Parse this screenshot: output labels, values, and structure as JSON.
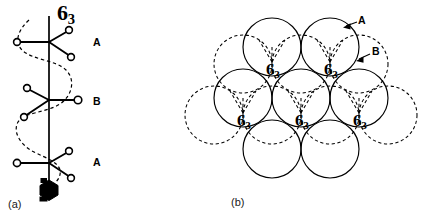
{
  "figure": {
    "panels": [
      {
        "id": "a",
        "caption": "(a)",
        "description": "6_3 screw axis with stacked A B A layers",
        "screw_axis": {
          "symbol_main": "6",
          "symbol_sub": "3",
          "label_x": 57,
          "label_y": 4,
          "font_size": 22
        },
        "layer_labels": [
          {
            "text": "A",
            "x": 93,
            "y": 36
          },
          {
            "text": "B",
            "x": 93,
            "y": 95
          },
          {
            "text": "A",
            "x": 93,
            "y": 156
          }
        ],
        "nodes": [
          {
            "layer": "A",
            "hub": {
              "x": 49,
              "y": 42
            },
            "arms": [
              {
                "x": 17,
                "y": 42
              },
              {
                "x": 69,
                "y": 30
              },
              {
                "x": 71,
                "y": 57
              }
            ]
          },
          {
            "layer": "B",
            "hub": {
              "x": 49,
              "y": 100
            },
            "arms": [
              {
                "x": 27,
                "y": 88
              },
              {
                "x": 24,
                "y": 117
              },
              {
                "x": 78,
                "y": 100
              }
            ]
          },
          {
            "layer": "A",
            "hub": {
              "x": 49,
              "y": 163
            },
            "arms": [
              {
                "x": 17,
                "y": 163
              },
              {
                "x": 69,
                "y": 151
              },
              {
                "x": 71,
                "y": 178
              }
            ]
          }
        ],
        "axis": {
          "x": 49,
          "y_top": 16,
          "y_bottom": 186
        },
        "screw_symbol_marker": {
          "x": 49,
          "y": 189,
          "radius": 9
        }
      },
      {
        "id": "b",
        "caption": "(b)",
        "description": "Hexagonal close packed layers A (solid) and B (dashed) with 6_3 screw axis positions",
        "pointer_labels": [
          {
            "text": "A",
            "label_x": 158,
            "label_y": 16,
            "tip_x": 144,
            "tip_y": 27,
            "tail_x": 157,
            "tail_y": 22
          },
          {
            "text": "B",
            "label_x": 172,
            "label_y": 47,
            "tip_x": 156,
            "tip_y": 61,
            "tail_x": 170,
            "tail_y": 54
          }
        ],
        "circle_radius": 29,
        "layer_a_circles": [
          {
            "cx": 72,
            "cy": 47
          },
          {
            "cx": 130,
            "cy": 47
          },
          {
            "cx": 43,
            "cy": 98
          },
          {
            "cx": 101,
            "cy": 98
          },
          {
            "cx": 159,
            "cy": 98
          },
          {
            "cx": 72,
            "cy": 149
          },
          {
            "cx": 130,
            "cy": 149
          }
        ],
        "layer_b_circles": [
          {
            "cx": 43,
            "cy": 64
          },
          {
            "cx": 101,
            "cy": 64
          },
          {
            "cx": 159,
            "cy": 64
          },
          {
            "cx": 14,
            "cy": 115
          },
          {
            "cx": 72,
            "cy": 115
          },
          {
            "cx": 130,
            "cy": 115
          },
          {
            "cx": 188,
            "cy": 115
          }
        ],
        "screw_axis_labels": [
          {
            "symbol_main": "6",
            "symbol_sub": "3",
            "x": 66,
            "y": 70,
            "font_size": 17
          },
          {
            "symbol_main": "6",
            "symbol_sub": "3",
            "x": 124,
            "y": 70,
            "font_size": 17
          },
          {
            "symbol_main": "6",
            "symbol_sub": "3",
            "x": 37,
            "y": 121,
            "font_size": 17
          },
          {
            "symbol_main": "6",
            "symbol_sub": "3",
            "x": 95,
            "y": 121,
            "font_size": 17
          },
          {
            "symbol_main": "6",
            "symbol_sub": "3",
            "x": 153,
            "y": 121,
            "font_size": 17
          }
        ]
      }
    ]
  },
  "colors": {
    "ink": "#000000",
    "background": "#ffffff",
    "caption": "#1a1a1a"
  }
}
